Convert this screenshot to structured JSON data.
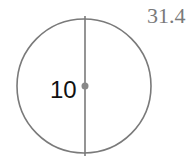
{
  "diagram": {
    "type": "circle-with-diameter",
    "diameter_label": "10",
    "result_label": "31.4",
    "colors": {
      "stroke": "#7a7a7a",
      "center_dot": "#888888",
      "result_text": "#7a7a7a",
      "label_text": "#111111"
    }
  }
}
